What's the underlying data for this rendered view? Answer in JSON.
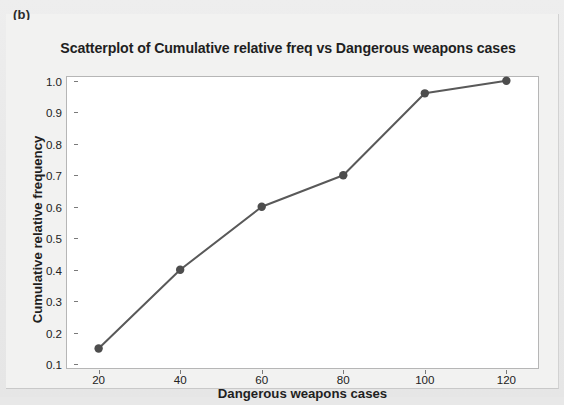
{
  "figure": {
    "panel_label": "(b)"
  },
  "chart_data": {
    "type": "line",
    "title": "Scatterplot of Cumulative relative freq vs Dangerous weapons cases",
    "xlabel": "Dangerous weapons cases",
    "ylabel": "Cumulative relative frequency",
    "x": [
      20,
      40,
      60,
      80,
      100,
      120
    ],
    "values": [
      0.15,
      0.4,
      0.6,
      0.7,
      0.96,
      1.0
    ],
    "series": [
      {
        "name": "Cumulative relative frequency",
        "values": [
          0.15,
          0.4,
          0.6,
          0.7,
          0.96,
          1.0
        ]
      }
    ],
    "xlim": [
      12,
      128
    ],
    "ylim": [
      0.085,
      1.015
    ],
    "xticks": [
      "20",
      "40",
      "60",
      "80",
      "100",
      "120"
    ],
    "xtick_values": [
      20,
      40,
      60,
      80,
      100,
      120
    ],
    "yticks": [
      "0.1",
      "0.2",
      "0.3",
      "0.4",
      "0.5",
      "0.6",
      "0.7",
      "0.8",
      "0.9",
      "1.0"
    ],
    "ytick_values": [
      0.1,
      0.2,
      0.3,
      0.4,
      0.5,
      0.6,
      0.7,
      0.8,
      0.9,
      1.0
    ],
    "grid": false,
    "legend": "none",
    "marker": "circle",
    "line_color": "#595959",
    "marker_color": "#4d4d4d",
    "plot_background": "#ffffff",
    "frame_color": "#b6b6b6"
  }
}
